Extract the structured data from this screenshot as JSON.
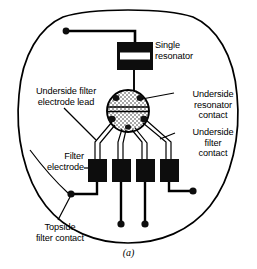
{
  "figure": {
    "caption": "(a)",
    "labels": {
      "single_resonator": "Single\nresonator",
      "underside_filter_electrode_lead": "Underside filter\nelectrode lead",
      "underside_resonator_contact": "Underside\nresonator\ncontact",
      "underside_filter_contact": "Underside\nfilter\ncontact",
      "filter_electrode": "Filter\nelectrode",
      "topside_filter_contact": "Topside\nfilter contact"
    },
    "colors": {
      "line": "#000000",
      "fill_black": "#0d0d0d",
      "background": "#ffffff",
      "hatch_light": "#d8d8d8"
    },
    "geometry": {
      "outline_shape": "rounded-circle-flat-top",
      "resonator_block": {
        "x": 117,
        "y": 42,
        "width": 36,
        "height": 28
      },
      "resonator_slot": {
        "x": 120,
        "y": 53,
        "width": 30,
        "height": 7
      },
      "circular_contact": {
        "cx": 128,
        "cy": 111,
        "r": 21
      },
      "electrode_count": 4,
      "electrodes": [
        {
          "x": 88,
          "y": 159,
          "width": 18,
          "height": 23
        },
        {
          "x": 112,
          "y": 159,
          "width": 18,
          "height": 23
        },
        {
          "x": 136,
          "y": 159,
          "width": 18,
          "height": 23
        },
        {
          "x": 160,
          "y": 159,
          "width": 18,
          "height": 23
        }
      ],
      "terminal_dots": 5
    }
  }
}
